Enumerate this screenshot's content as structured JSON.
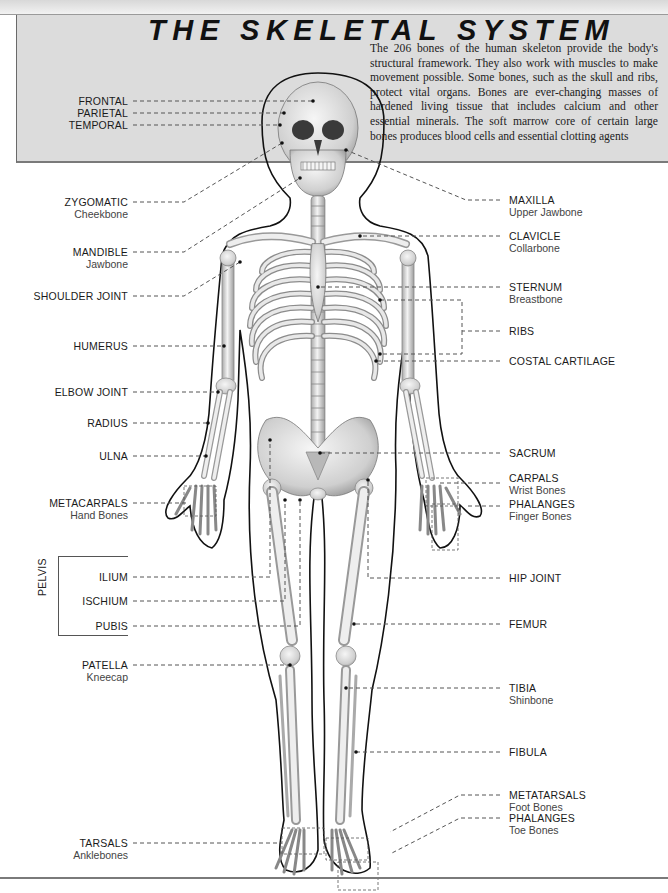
{
  "header": {
    "title": "THE SKELETAL SYSTEM",
    "intro": "The 206 bones of the human skeleton provide the body's structural framework. They also work with muscles to make movement possible. Some bones, such as the skull and ribs, protect vital organs. Bones are ever-changing masses of hardened living tissue that includes calcium and other essential minerals. The soft marrow core of certain large bones produces blood cells and essential clotting agents"
  },
  "colors": {
    "header_bg": "#dcdcdc",
    "bone": "#e6e6e6",
    "bone_shadow": "#9a9a9a",
    "outline": "#111111",
    "leader": "#555555"
  },
  "labels_left": [
    {
      "name": "FRONTAL",
      "sub": ""
    },
    {
      "name": "PARIETAL",
      "sub": ""
    },
    {
      "name": "TEMPORAL",
      "sub": ""
    },
    {
      "name": "ZYGOMATIC",
      "sub": "Cheekbone"
    },
    {
      "name": "MANDIBLE",
      "sub": "Jawbone"
    },
    {
      "name": "SHOULDER JOINT",
      "sub": ""
    },
    {
      "name": "HUMERUS",
      "sub": ""
    },
    {
      "name": "ELBOW JOINT",
      "sub": ""
    },
    {
      "name": "RADIUS",
      "sub": ""
    },
    {
      "name": "ULNA",
      "sub": ""
    },
    {
      "name": "METACARPALS",
      "sub": "Hand Bones"
    },
    {
      "name": "ILIUM",
      "sub": ""
    },
    {
      "name": "ISCHIUM",
      "sub": ""
    },
    {
      "name": "PUBIS",
      "sub": ""
    },
    {
      "name": "PATELLA",
      "sub": "Kneecap"
    },
    {
      "name": "TARSALS",
      "sub": "Anklebones"
    }
  ],
  "pelvis_group_label": "PELVIS",
  "labels_right": [
    {
      "name": "MAXILLA",
      "sub": "Upper Jawbone"
    },
    {
      "name": "CLAVICLE",
      "sub": "Collarbone"
    },
    {
      "name": "STERNUM",
      "sub": "Breastbone"
    },
    {
      "name": "RIBS",
      "sub": ""
    },
    {
      "name": "COSTAL CARTILAGE",
      "sub": ""
    },
    {
      "name": "SACRUM",
      "sub": ""
    },
    {
      "name": "CARPALS",
      "sub": "Wrist Bones"
    },
    {
      "name": "PHALANGES",
      "sub": "Finger Bones"
    },
    {
      "name": "HIP JOINT",
      "sub": ""
    },
    {
      "name": "FEMUR",
      "sub": ""
    },
    {
      "name": "TIBIA",
      "sub": "Shinbone"
    },
    {
      "name": "FIBULA",
      "sub": ""
    },
    {
      "name": "METATARSALS",
      "sub": "Foot Bones"
    },
    {
      "name": "PHALANGES",
      "sub": "Toe Bones"
    }
  ]
}
